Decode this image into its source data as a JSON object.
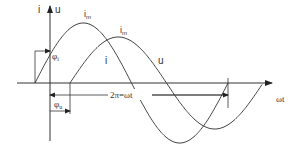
{
  "diagram": {
    "type": "phase-shift sine waveform",
    "axes": {
      "vertical_label_left": "i",
      "vertical_label_right": "u",
      "horizontal_label": "ωt"
    },
    "curves": [
      {
        "id": "u",
        "label": "u",
        "peak_label": "Um",
        "peak_label_main": "i",
        "peak_label_sub": "m",
        "color": "#444444"
      },
      {
        "id": "i",
        "label": "i",
        "peak_label": "Im",
        "peak_label_main": "i",
        "peak_label_sub": "m",
        "color": "#444444"
      }
    ],
    "annotations": {
      "phi_i": {
        "main": "φ",
        "sub": "i"
      },
      "phi_u": {
        "main": "φ",
        "sub": "u"
      },
      "period": "2π=ωt"
    },
    "colors": {
      "line": "#444444",
      "axis": "#333333",
      "background": "#ffffff"
    }
  }
}
